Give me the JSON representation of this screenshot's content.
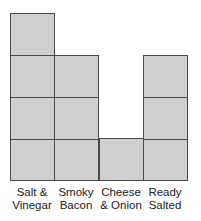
{
  "chart_data": {
    "type": "bar",
    "subtype": "block-graph",
    "title": "",
    "xlabel": "",
    "ylabel": "",
    "categories": [
      "Salt & Vinegar",
      "Smoky Bacon",
      "Cheese & Onion",
      "Ready Salted"
    ],
    "category_lines": [
      [
        "Salt &",
        "Vinegar"
      ],
      [
        "Smoky",
        "Bacon"
      ],
      [
        "Cheese",
        "& Onion"
      ],
      [
        "Ready",
        "Salted"
      ]
    ],
    "values": [
      4,
      3,
      1,
      3
    ],
    "ylim": [
      0,
      4
    ],
    "grid": false,
    "legend": null,
    "colors": {
      "block_fill": "#cfcfcf",
      "block_border": "#4a4a4a",
      "label_text": "#222222"
    }
  },
  "layout": {
    "left": 10,
    "bottom": 180,
    "col_width": 44.25,
    "row_height": 41.75,
    "label_top": 186
  }
}
